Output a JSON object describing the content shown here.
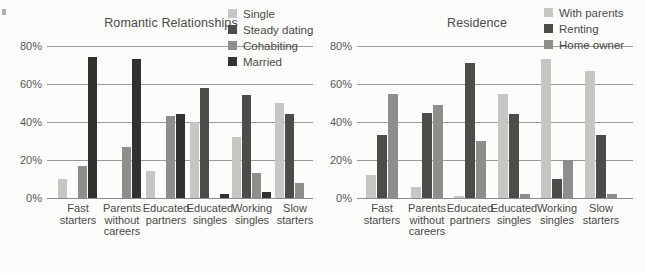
{
  "page": {
    "background": "#fcfcfa",
    "text_color": "#4a4a48",
    "gridline_color": "#9b9b99"
  },
  "chart_data": [
    {
      "type": "bar",
      "title": "Romantic Relationships",
      "xlabel": "",
      "ylabel": "",
      "ylim": [
        0,
        80
      ],
      "yticks": [
        0,
        20,
        40,
        60,
        80
      ],
      "ytick_suffix": "%",
      "grid": true,
      "legend_position": "top-right",
      "categories": [
        "Fast starters",
        "Parents without careers",
        "Educated partners",
        "Educated singles",
        "Working singles",
        "Slow starters"
      ],
      "category_lines": [
        [
          "Fast",
          "starters"
        ],
        [
          "Parents",
          "without",
          "careers"
        ],
        [
          "Educated",
          "partners"
        ],
        [
          "Educated",
          "singles"
        ],
        [
          "Working",
          "singles"
        ],
        [
          "Slow",
          "starters"
        ]
      ],
      "series": [
        {
          "name": "Single",
          "color": "#c6c6c3",
          "values": [
            10,
            0,
            14,
            40,
            32,
            50
          ]
        },
        {
          "name": "Steady dating",
          "color": "#4c4c49",
          "values": [
            0,
            0,
            0,
            58,
            54,
            44
          ]
        },
        {
          "name": "Cohabiting",
          "color": "#8e8e8b",
          "values": [
            17,
            27,
            43,
            0,
            13,
            8
          ]
        },
        {
          "name": "Married",
          "color": "#31312e",
          "values": [
            74,
            73,
            44,
            2,
            3,
            0
          ]
        }
      ]
    },
    {
      "type": "bar",
      "title": "Residence",
      "xlabel": "",
      "ylabel": "",
      "ylim": [
        0,
        80
      ],
      "yticks": [
        0,
        20,
        40,
        60,
        80
      ],
      "ytick_suffix": "%",
      "grid": true,
      "legend_position": "top-right",
      "categories": [
        "Fast starters",
        "Parents without careers",
        "Educated partners",
        "Educated singles",
        "Working singles",
        "Slow starters"
      ],
      "category_lines": [
        [
          "Fast",
          "starters"
        ],
        [
          "Parents",
          "without",
          "careers"
        ],
        [
          "Educated",
          "partners"
        ],
        [
          "Educated",
          "singles"
        ],
        [
          "Working",
          "singles"
        ],
        [
          "Slow",
          "starters"
        ]
      ],
      "series": [
        {
          "name": "With parents",
          "color": "#c6c6c3",
          "values": [
            12,
            6,
            1,
            55,
            73,
            67
          ]
        },
        {
          "name": "Renting",
          "color": "#4c4c49",
          "values": [
            33,
            45,
            71,
            44,
            10,
            33
          ]
        },
        {
          "name": "Home owner",
          "color": "#8e8e8b",
          "values": [
            55,
            49,
            30,
            2,
            20,
            2
          ]
        }
      ]
    }
  ]
}
